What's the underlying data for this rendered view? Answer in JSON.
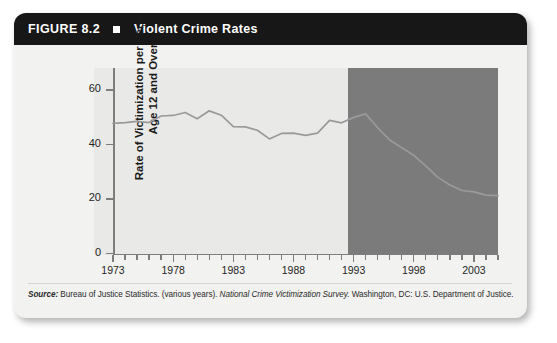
{
  "figure": {
    "number": "FIGURE 8.2",
    "marker_icon": "square-bullet-icon",
    "title": "Violent Crime Rates"
  },
  "source": {
    "label": "Source:",
    "text_before": " Bureau of Justice Statistics. (various years). ",
    "italic_title": "National Crime Victimization Survey.",
    "text_after": " Washington, DC: U.S. Department of Justice."
  },
  "colors": {
    "header_bar": "#171717",
    "card_background": "#f2f2f0",
    "plot_background": "#e9e9e7",
    "shaded_region": "#7b7b7b",
    "series_line": "#9a9a9a",
    "axis": "#7d7d7d"
  },
  "chart_data": {
    "type": "line",
    "title": "Violent Crime Rates",
    "xlabel": "",
    "ylabel": "Rate of Victimization per Persons Age 12 and Over",
    "xlim": [
      1973,
      2005
    ],
    "ylim": [
      0,
      68
    ],
    "yticks": [
      0,
      20,
      40,
      60
    ],
    "xticks": [
      1973,
      1978,
      1983,
      1988,
      1993,
      1998,
      2003
    ],
    "xtick_all_years": [
      1973,
      1974,
      1975,
      1976,
      1977,
      1978,
      1979,
      1980,
      1981,
      1982,
      1983,
      1984,
      1985,
      1986,
      1987,
      1988,
      1989,
      1990,
      1991,
      1992,
      1993,
      1994,
      1995,
      1996,
      1997,
      1998,
      1999,
      2000,
      2001,
      2002,
      2003,
      2004,
      2005
    ],
    "grid": false,
    "legend": false,
    "shaded_region": {
      "label": "highlighted period",
      "x_start": 1992.5,
      "x_end": 2005.0
    },
    "x": [
      1973,
      1974,
      1975,
      1976,
      1977,
      1978,
      1979,
      1980,
      1981,
      1982,
      1983,
      1984,
      1985,
      1986,
      1987,
      1988,
      1989,
      1990,
      1991,
      1992,
      1993,
      1994,
      1995,
      1996,
      1997,
      1998,
      1999,
      2000,
      2001,
      2002,
      2003,
      2004,
      2005
    ],
    "values": [
      47.7,
      48.0,
      48.4,
      48.0,
      50.4,
      50.6,
      51.7,
      49.4,
      52.3,
      50.7,
      46.5,
      46.4,
      45.2,
      42.0,
      44.0,
      44.1,
      43.3,
      44.1,
      48.8,
      47.9,
      49.9,
      51.2,
      46.1,
      41.6,
      38.8,
      36.0,
      32.1,
      27.9,
      25.1,
      23.1,
      22.6,
      21.4,
      21.2
    ],
    "series": [
      {
        "name": "Rate of victimization per 1,000 persons age 12 and over",
        "values": [
          47.7,
          48.0,
          48.4,
          48.0,
          50.4,
          50.6,
          51.7,
          49.4,
          52.3,
          50.7,
          46.5,
          46.4,
          45.2,
          42.0,
          44.0,
          44.1,
          43.3,
          44.1,
          48.8,
          47.9,
          49.9,
          51.2,
          46.1,
          41.6,
          38.8,
          36.0,
          32.1,
          27.9,
          25.1,
          23.1,
          22.6,
          21.4,
          21.2
        ]
      }
    ]
  }
}
